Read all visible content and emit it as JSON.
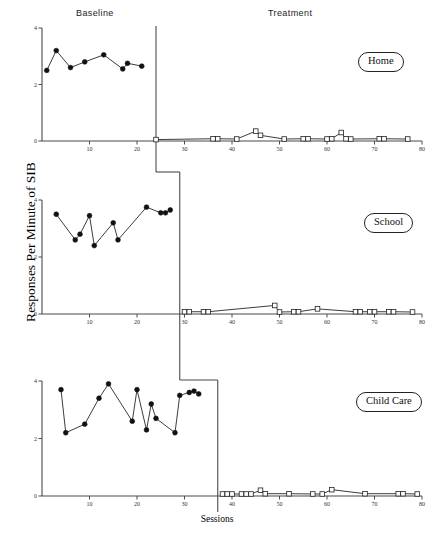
{
  "figure": {
    "phase_headers": {
      "baseline": "Baseline",
      "treatment": "Treatment"
    },
    "axis_titles": {
      "y": "Responses Per Minute of SIB",
      "x": "Sessions"
    },
    "setting_labels": {
      "home": "Home",
      "school": "School",
      "child_care": "Child Care"
    }
  },
  "chart_data": {
    "type": "line",
    "title": "",
    "subtitle": "",
    "xlabel": "Sessions",
    "ylabel": "Responses Per Minute of SIB",
    "xlim": [
      0,
      80
    ],
    "ylim": [
      0,
      4
    ],
    "grid": false,
    "legend": "none",
    "x_ticks": [
      10,
      20,
      30,
      40,
      50,
      60,
      70,
      80
    ],
    "y_ticks": [
      0,
      2,
      4
    ],
    "design": "multiple-baseline-across-settings",
    "panels": [
      {
        "name": "Home",
        "phase_change_session": 24,
        "series": [
          {
            "name": "Baseline",
            "marker": "filled-circle",
            "x": [
              1,
              3,
              6,
              9,
              13,
              17,
              18,
              21
            ],
            "values": [
              2.5,
              3.2,
              2.6,
              2.8,
              3.05,
              2.55,
              2.75,
              2.65
            ]
          },
          {
            "name": "Treatment",
            "marker": "open-square",
            "x": [
              24,
              36,
              37,
              41,
              45,
              46,
              51,
              55,
              56,
              60,
              61,
              63,
              64,
              65,
              71,
              72,
              77
            ],
            "values": [
              0.05,
              0.08,
              0.08,
              0.07,
              0.35,
              0.2,
              0.07,
              0.08,
              0.08,
              0.07,
              0.08,
              0.3,
              0.08,
              0.07,
              0.08,
              0.08,
              0.07
            ]
          }
        ]
      },
      {
        "name": "School",
        "phase_change_session": 29,
        "series": [
          {
            "name": "Baseline",
            "marker": "filled-circle",
            "x": [
              3,
              7,
              8,
              10,
              11,
              15,
              16,
              22,
              25,
              26,
              27
            ],
            "values": [
              3.5,
              2.6,
              2.8,
              3.45,
              2.4,
              3.2,
              2.6,
              3.75,
              3.55,
              3.55,
              3.65
            ]
          },
          {
            "name": "Treatment",
            "marker": "open-square",
            "x": [
              30,
              31,
              34,
              35,
              49,
              50,
              53,
              54,
              58,
              66,
              67,
              69,
              70,
              73,
              74,
              78
            ],
            "values": [
              0.08,
              0.08,
              0.08,
              0.08,
              0.3,
              0.07,
              0.08,
              0.08,
              0.18,
              0.08,
              0.08,
              0.08,
              0.08,
              0.08,
              0.08,
              0.07
            ]
          }
        ]
      },
      {
        "name": "Child Care",
        "phase_change_session": 37,
        "series": [
          {
            "name": "Baseline",
            "marker": "filled-circle",
            "x": [
              4,
              5,
              9,
              12,
              14,
              19,
              20,
              22,
              23,
              24,
              28,
              29,
              31,
              32,
              33
            ],
            "values": [
              3.7,
              2.2,
              2.5,
              3.4,
              3.9,
              2.6,
              3.7,
              2.3,
              3.2,
              2.7,
              2.2,
              3.5,
              3.6,
              3.65,
              3.55
            ]
          },
          {
            "name": "Treatment",
            "marker": "open-square",
            "x": [
              38,
              39,
              40,
              42,
              43,
              44,
              46,
              47,
              52,
              57,
              59,
              61,
              68,
              75,
              76,
              79
            ],
            "values": [
              0.07,
              0.07,
              0.07,
              0.07,
              0.07,
              0.07,
              0.2,
              0.08,
              0.08,
              0.07,
              0.07,
              0.22,
              0.08,
              0.08,
              0.08,
              0.07
            ]
          }
        ]
      }
    ]
  }
}
